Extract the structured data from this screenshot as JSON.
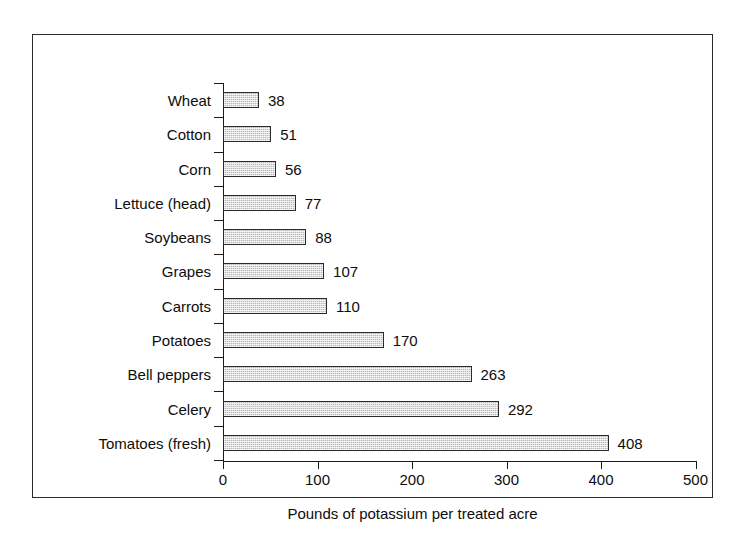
{
  "chart_data": {
    "type": "bar",
    "orientation": "horizontal",
    "title": "",
    "xlabel": "Pounds of potassium per treated acre",
    "ylabel": "",
    "xlim": [
      0,
      500
    ],
    "xticks": [
      0,
      100,
      200,
      300,
      400,
      500
    ],
    "grid": false,
    "legend": false,
    "categories": [
      "Wheat",
      "Cotton",
      "Corn",
      "Lettuce (head)",
      "Soybeans",
      "Grapes",
      "Carrots",
      "Potatoes",
      "Bell peppers",
      "Celery",
      "Tomatoes (fresh)"
    ],
    "values": [
      38,
      51,
      56,
      77,
      88,
      107,
      110,
      170,
      263,
      292,
      408
    ],
    "value_labels": [
      "38",
      "51",
      "56",
      "77",
      "88",
      "107",
      "110",
      "170",
      "263",
      "292",
      "408"
    ],
    "bar_fill_color": "#b9b9b9",
    "bar_border_color": "#2a2a2a",
    "axis_color": "#1a1a1a",
    "frame_color": "#2b2b2b",
    "background_color": "#ffffff"
  }
}
